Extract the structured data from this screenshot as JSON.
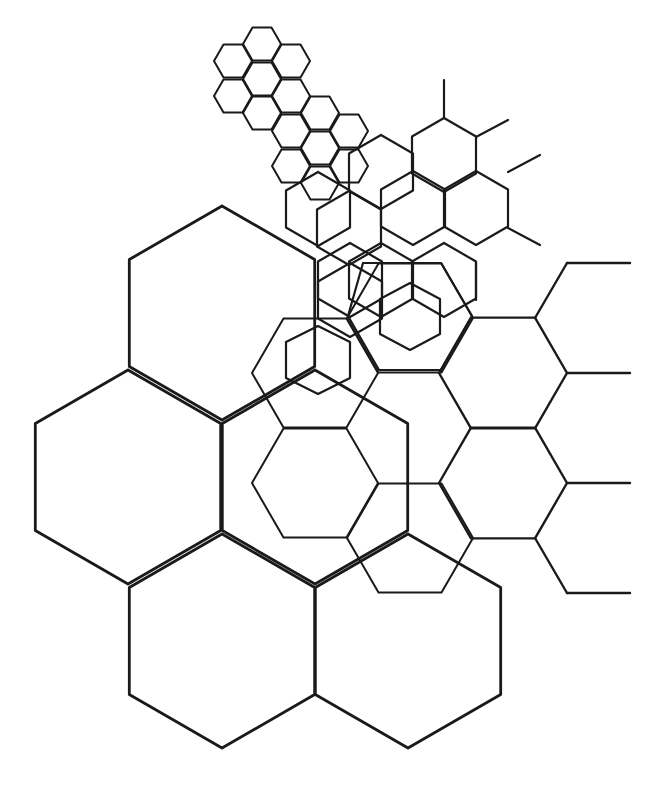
{
  "diagram": {
    "title": "",
    "background": "#ffffff",
    "stroke_color": "#1a1a1a",
    "layers": [
      {
        "name": "large-pointy-hex-grid",
        "kind": "hex-grid",
        "orientation": "pointy",
        "radius": 107,
        "stroke_width": 2.8,
        "centers": [
          [
            222,
            313
          ],
          [
            128,
            477
          ],
          [
            315,
            477
          ],
          [
            222,
            641
          ],
          [
            408,
            641
          ]
        ],
        "partial": []
      },
      {
        "name": "right-flat-hex-column",
        "kind": "hex-grid",
        "orientation": "flat",
        "radius": 64,
        "stroke_width": 2.4,
        "centers": [
          [
            503,
            373
          ],
          [
            503,
            483
          ]
        ],
        "stubs": [
          [
            567,
            263,
            630,
            263
          ],
          [
            535,
            318,
            567,
            263
          ],
          [
            567,
            373,
            630,
            373
          ],
          [
            567,
            483,
            630,
            483
          ],
          [
            535,
            538,
            567,
            593
          ],
          [
            567,
            593,
            630,
            593
          ]
        ]
      },
      {
        "name": "upper-right-pointy-hex-grid",
        "kind": "hex-grid",
        "orientation": "pointy",
        "radius": 37,
        "stroke_width": 2.2,
        "centers": [
          [
            444,
            155
          ],
          [
            381,
            172
          ],
          [
            413,
            208
          ],
          [
            476,
            208
          ],
          [
            349,
            228
          ],
          [
            318,
            209
          ],
          [
            381,
            280
          ],
          [
            444,
            280
          ],
          [
            350,
            280
          ],
          [
            350,
            300
          ]
        ],
        "stubs": [
          [
            444,
            80,
            444,
            118
          ],
          [
            476,
            137,
            508,
            120
          ],
          [
            508,
            172,
            540,
            155
          ],
          [
            508,
            228,
            540,
            245
          ],
          [
            476,
            263,
            476,
            300
          ]
        ]
      },
      {
        "name": "small-flat-hex-cluster",
        "kind": "hex-grid",
        "orientation": "flat",
        "radius": 19,
        "stroke_width": 2.0,
        "centers": [
          [
            262,
            44
          ],
          [
            233,
            61
          ],
          [
            291,
            61
          ],
          [
            262,
            79
          ],
          [
            233,
            96
          ],
          [
            291,
            96
          ],
          [
            262,
            113
          ],
          [
            320,
            113
          ],
          [
            291,
            131
          ],
          [
            349,
            131
          ],
          [
            320,
            148
          ],
          [
            291,
            166
          ],
          [
            349,
            166
          ],
          [
            320,
            183
          ]
        ]
      },
      {
        "name": "mid-flat-hexes",
        "kind": "hex-grid",
        "orientation": "flat",
        "radius": 63,
        "stroke_width": 2.0,
        "centers": [
          [
            315,
            373
          ],
          [
            315,
            483
          ],
          [
            410,
            538
          ],
          [
            410,
            318
          ]
        ],
        "partial": []
      },
      {
        "name": "rosette",
        "kind": "polylines",
        "stroke_width": 2.2,
        "paths": [
          [
            [
              380,
              299
            ],
            [
              410,
              283
            ],
            [
              440,
              299
            ],
            [
              440,
              334
            ],
            [
              410,
              350
            ],
            [
              380,
              334
            ],
            [
              380,
              299
            ]
          ],
          [
            [
              363,
              263
            ],
            [
              441,
              263
            ],
            [
              472,
              316
            ],
            [
              441,
              370
            ],
            [
              379,
              370
            ],
            [
              348,
              316
            ],
            [
              363,
              263
            ]
          ],
          [
            [
              286,
              342
            ],
            [
              318,
              326
            ],
            [
              350,
              342
            ],
            [
              350,
              378
            ],
            [
              318,
              394
            ],
            [
              286,
              378
            ],
            [
              286,
              342
            ]
          ]
        ]
      }
    ]
  }
}
